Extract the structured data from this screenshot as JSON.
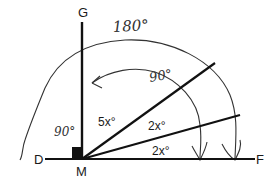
{
  "diagram": {
    "type": "angle-diagram",
    "points": {
      "G": "G",
      "D": "D",
      "M": "M",
      "F": "F"
    },
    "angle_labels": {
      "top": "5x°",
      "middle": "2x°",
      "bottom": "2x°"
    },
    "annotations": {
      "straight_angle": "180°",
      "right_angle_top": "90°",
      "right_angle_left": "90°"
    },
    "colors": {
      "line": "#111111",
      "arc": "#333333",
      "background": "#ffffff"
    }
  }
}
